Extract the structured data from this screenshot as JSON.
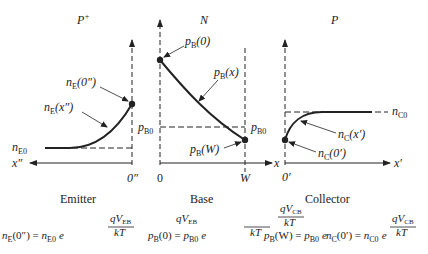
{
  "regions": [
    {
      "id": "emitter",
      "doping": "P",
      "doping_sup": "+",
      "caption": "Emitter",
      "curve_label": "n",
      "curve_label_sub": "E",
      "curve_label_arg": "(x″)",
      "boundary_label": "n",
      "boundary_label_sub": "E",
      "boundary_label_arg": "(0″)",
      "equilibrium_label": "n",
      "equilibrium_label_sub": "E0",
      "axis_label": "x″",
      "origin_label": "0″"
    },
    {
      "id": "base",
      "doping": "N",
      "caption": "Base",
      "curve_label": "p",
      "curve_label_sub": "B",
      "curve_label_arg": "(x)",
      "boundary_left_label": "p",
      "boundary_left_sub": "B",
      "boundary_left_arg": "(0)",
      "boundary_right_label": "p",
      "boundary_right_sub": "B",
      "boundary_right_arg": "(W)",
      "equilibrium_label": "p",
      "equilibrium_label_sub": "B0",
      "axis_label": "x",
      "origin_label": "0",
      "width_label": "W"
    },
    {
      "id": "collector",
      "doping": "P",
      "caption": "Collector",
      "curve_label": "n",
      "curve_label_sub": "C",
      "curve_label_arg": "(x′)",
      "boundary_label": "n",
      "boundary_label_sub": "C",
      "boundary_label_arg": "(0′)",
      "equilibrium_label": "n",
      "equilibrium_label_sub": "C0",
      "axis_label": "x′",
      "origin_label": "0′"
    }
  ],
  "equations": [
    {
      "lhs": "n",
      "lhs_sub": "E",
      "lhs_arg": "(0″) = ",
      "rhs": "n",
      "rhs_sub": "E0",
      "e": "e",
      "num": "qV",
      "num_sub": "EB",
      "den": "kT"
    },
    {
      "lhs": "p",
      "lhs_sub": "B",
      "lhs_arg": "(0) = ",
      "rhs": "p",
      "rhs_sub": "B0",
      "e": "e",
      "num": "qV",
      "num_sub": "EB",
      "den": "kT"
    },
    {
      "lhs": "p",
      "lhs_sub": "B",
      "lhs_arg": "(W) = ",
      "rhs": "p",
      "rhs_sub": "B0",
      "e": "e",
      "num": "qV",
      "num_sub": "CB",
      "den": "kT"
    },
    {
      "lhs": "n",
      "lhs_sub": "C",
      "lhs_arg": "(0′) = ",
      "rhs": "n",
      "rhs_sub": "C0",
      "e": "e",
      "num": "qV",
      "num_sub": "CB",
      "den": "kT"
    }
  ],
  "colors": {
    "ink": "#222222",
    "background": "#ffffff"
  }
}
